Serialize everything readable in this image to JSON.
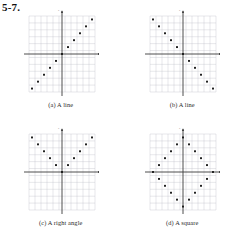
{
  "exercise": {
    "label": "5-7."
  },
  "axis_labels": {
    "x": "x",
    "y": "y"
  },
  "panels": [
    {
      "id": "panel-a",
      "caption": "(a) A line",
      "chart_data": {
        "type": "scatter",
        "title": "(a) A line",
        "xlabel": "x",
        "ylabel": "y",
        "xlim": [
          -6,
          6
        ],
        "ylim": [
          -6,
          6
        ],
        "grid": true,
        "legend": "none",
        "x": [
          -5,
          -4,
          -3,
          -2,
          -1,
          0,
          1,
          2,
          3,
          4,
          5
        ],
        "y": [
          -5,
          -4,
          -3,
          -2,
          -1,
          0,
          1,
          2,
          3,
          4,
          5
        ]
      }
    },
    {
      "id": "panel-b",
      "caption": "(b) A line",
      "chart_data": {
        "type": "scatter",
        "title": "(b) A line",
        "xlabel": "x",
        "ylabel": "y",
        "xlim": [
          -6,
          6
        ],
        "ylim": [
          -6,
          6
        ],
        "grid": true,
        "legend": "none",
        "x": [
          -5,
          -4,
          -3,
          -2,
          -1,
          0,
          1,
          2,
          3,
          4,
          5
        ],
        "y": [
          5,
          4,
          3,
          2,
          1,
          0,
          -1,
          -2,
          -3,
          -4,
          -5
        ]
      }
    },
    {
      "id": "panel-c",
      "caption": "(c) A right angle",
      "chart_data": {
        "type": "scatter",
        "title": "(c) A right angle",
        "xlabel": "x",
        "ylabel": "y",
        "xlim": [
          -6,
          6
        ],
        "ylim": [
          -6,
          6
        ],
        "grid": true,
        "legend": "none",
        "x": [
          -5,
          -4,
          -3,
          -2,
          -1,
          0,
          1,
          2,
          3,
          4,
          5
        ],
        "y": [
          5,
          4,
          3,
          2,
          1,
          0,
          1,
          2,
          3,
          4,
          5
        ]
      }
    },
    {
      "id": "panel-d",
      "caption": "(d) A square",
      "chart_data": {
        "type": "scatter",
        "title": "(d) A square",
        "xlabel": "x",
        "ylabel": "y",
        "xlim": [
          -6,
          6
        ],
        "ylim": [
          -6,
          6
        ],
        "grid": true,
        "legend": "none",
        "x": [
          0,
          1,
          2,
          3,
          4,
          5,
          4,
          3,
          2,
          1,
          0,
          -1,
          -2,
          -3,
          -4,
          -5,
          -4,
          -3,
          -2,
          -1
        ],
        "y": [
          5,
          4,
          3,
          2,
          1,
          0,
          -1,
          -2,
          -3,
          -4,
          -5,
          -4,
          -3,
          -2,
          -1,
          0,
          1,
          2,
          3,
          4
        ]
      }
    }
  ],
  "colors": {
    "point": "#171717",
    "axis": "#3a3a3a",
    "grid": "#b9bcc4",
    "background": "#ffffff"
  }
}
